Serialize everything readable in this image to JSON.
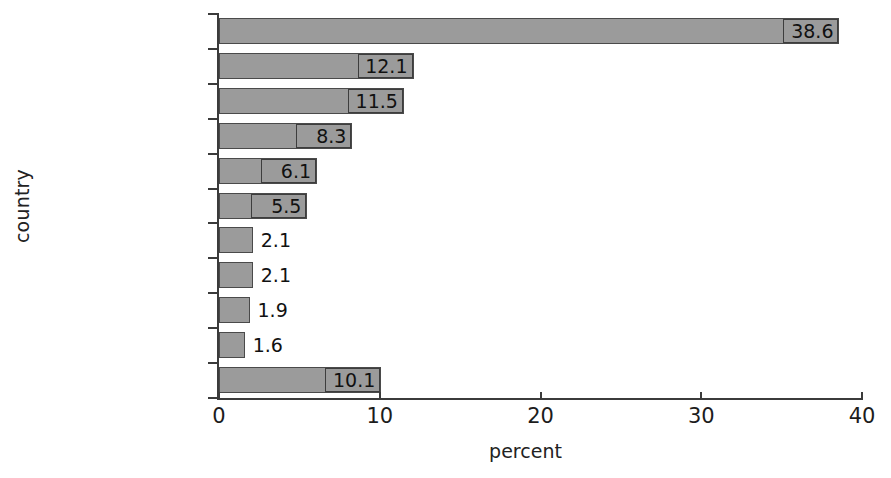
{
  "chart_data": {
    "type": "bar",
    "orientation": "horizontal",
    "title": "",
    "xlabel": "percent",
    "ylabel": "country",
    "categories": [
      "Philippines",
      "Brazil",
      "Nigeria",
      "Indonesia",
      "Vietnam",
      "Peru",
      "Thailand",
      "Yemen, Rep.",
      "Ecuador",
      "Colombia",
      "rest of the world"
    ],
    "values": [
      38.6,
      12.1,
      11.5,
      8.3,
      6.1,
      5.5,
      2.1,
      2.1,
      1.9,
      1.6,
      10.1
    ],
    "value_labels": [
      "38.6",
      "12.1",
      "11.5",
      "8.3",
      "6.1",
      "5.5",
      "2.1",
      "2.1",
      "1.9",
      "1.6",
      "10.1"
    ],
    "label_placement": [
      "inside",
      "inside",
      "inside",
      "inside",
      "inside",
      "inside",
      "outside",
      "outside",
      "outside",
      "outside",
      "inside"
    ],
    "xlim": [
      0,
      40
    ],
    "xticks": [
      0,
      10,
      20,
      30,
      40
    ],
    "xtick_labels": [
      "0",
      "10",
      "20",
      "30",
      "40"
    ],
    "grid": false,
    "legend": false,
    "bar_fill_color": "#9b9b9b",
    "bar_border_color": "#4a4a4a",
    "axis_color": "#3b3b3b",
    "background_color": "#ffffff"
  }
}
